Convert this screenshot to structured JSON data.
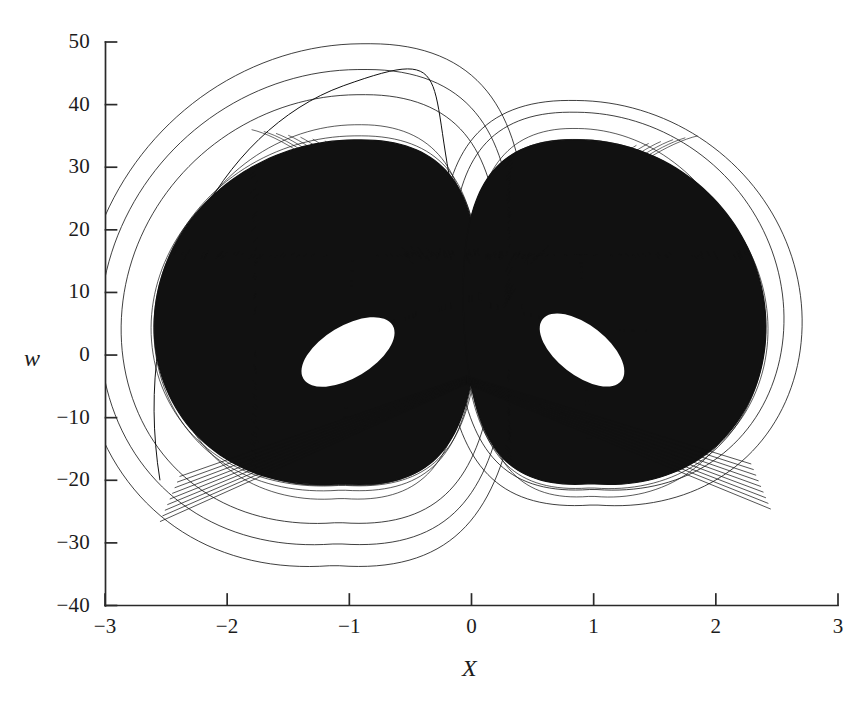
{
  "figure": {
    "kind": "phase-portrait",
    "background_color": "#ffffff",
    "ink_color": "#111111",
    "axis_color": "#2a2a2a"
  },
  "chart_data": {
    "type": "line",
    "title": "",
    "subtitle": "",
    "xlabel": "X",
    "ylabel": "w",
    "xlim": [
      -3,
      3
    ],
    "ylim": [
      -40,
      50
    ],
    "grid": false,
    "legend": null,
    "x_ticks": [
      -3,
      -2,
      -1,
      0,
      1,
      2,
      3
    ],
    "x_tick_labels": [
      "−3",
      "−2",
      "−1",
      "0",
      "1",
      "2",
      "3"
    ],
    "y_ticks": [
      -40,
      -30,
      -20,
      -10,
      0,
      10,
      20,
      30,
      40,
      50
    ],
    "y_tick_labels": [
      "−40",
      "−30",
      "−20",
      "−10",
      "0",
      "10",
      "20",
      "30",
      "40",
      "50"
    ],
    "tick_direction": "in",
    "series": [
      {
        "name": "attractor-trajectory",
        "color": "#111111",
        "line_width": 0.55,
        "point_count": 56000
      }
    ],
    "features": {
      "lobe_centers": [
        {
          "label": "left-core",
          "x": -1.0,
          "w": 3.0,
          "rx": 0.42,
          "ry": 0.21,
          "rotation_deg": -31
        },
        {
          "label": "right-core",
          "x": 0.92,
          "w": 4.0,
          "rx": 0.4,
          "ry": 0.2,
          "rotation_deg": 38
        }
      ],
      "crossing_vertex": {
        "x": 0.0,
        "w": -4.0
      },
      "max_w_outer_arc": 44,
      "max_w_main_band": 37,
      "min_w_outer_excursion": -33,
      "min_w_main_band": -26,
      "x_extent_left": -2.85,
      "x_extent_right": 2.62
    },
    "generator": {
      "note": "Visual reconstruction parameters for the nested-spiral double scroll",
      "bands": 46,
      "outer_loops": 3,
      "fill_density": 0.94
    }
  },
  "axes": {
    "y_axis_label": "w",
    "x_axis_label": "X"
  }
}
